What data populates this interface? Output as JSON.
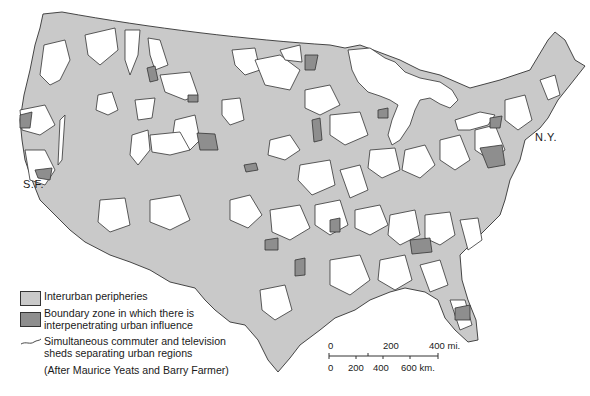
{
  "figure": {
    "type": "thematic-map",
    "region": "Conterminous United States",
    "colors": {
      "interurban_peripheries": "#c9c9c9",
      "boundary_zone": "#8e8e8e",
      "urban_region": "#ffffff",
      "outline": "#333333"
    }
  },
  "labels": {
    "sf": "S.F.",
    "ny": "N.Y."
  },
  "legend": {
    "items": [
      {
        "symbol": "light-gray-swatch",
        "label": "Interurban peripheries"
      },
      {
        "symbol": "dark-gray-swatch",
        "label_line1": "Boundary zone in which there is",
        "label_line2": "interpenetrating urban influence"
      },
      {
        "symbol": "wavy-line",
        "label_line1": "Simultaneous commuter and television",
        "label_line2": "sheds separating urban regions"
      }
    ],
    "credit": "(After Maurice Yeats and Barry Farmer)"
  },
  "scale_bar": {
    "miles": {
      "ticks": [
        "0",
        "200",
        "400 mi."
      ]
    },
    "km": {
      "ticks": [
        "0",
        "200",
        "400",
        "600 km."
      ]
    }
  }
}
